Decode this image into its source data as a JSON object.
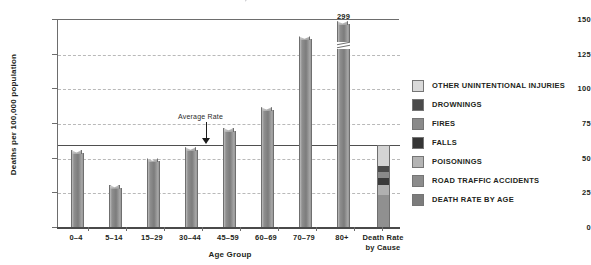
{
  "chart_data": {
    "type": "bar",
    "title": "FIGURE 1  PATTERN OF DEATH FROM INJURY BY AGE GROUP, 2000",
    "xlabel": "Age Group",
    "ylabel": "Deaths per 100,000 population",
    "ylim": [
      0,
      150
    ],
    "yticks": [
      0,
      25,
      50,
      75,
      100,
      125,
      150
    ],
    "grid": true,
    "legend_position": "right",
    "categories": [
      "0–4",
      "5–14",
      "15–29",
      "30–44",
      "45–59",
      "60–69",
      "70–79",
      "80+"
    ],
    "values": [
      54,
      29,
      48,
      56,
      70,
      85,
      136,
      299
    ],
    "value_labels": [
      "",
      "",
      "",
      "",
      "",
      "",
      "",
      "299"
    ],
    "axis_break_category": "80+",
    "annotation": {
      "label": "Average Rate",
      "value": 60
    },
    "stacked_bar": {
      "category_line1": "Death Rate",
      "category_line2": "by Cause",
      "total": 60,
      "segments": [
        {
          "name": "OTHER UNINTENTIONAL INJURIES",
          "value": 15,
          "color": "#d4d4d4"
        },
        {
          "name": "DROWNINGS",
          "value": 4,
          "color": "#4a4a4a"
        },
        {
          "name": "FIRES",
          "value": 5,
          "color": "#8a8a8a"
        },
        {
          "name": "FALLS",
          "value": 5,
          "color": "#3a3a3a"
        },
        {
          "name": "POISONINGS",
          "value": 7,
          "color": "#b0b0b0"
        },
        {
          "name": "ROAD TRAFFIC ACCIDENTS",
          "value": 24,
          "color": "#909090"
        }
      ]
    },
    "legend": [
      {
        "label": "OTHER UNINTENTIONAL INJURIES",
        "color": "#d9d9d9"
      },
      {
        "label": "DROWNINGS",
        "color": "#4a4a4a"
      },
      {
        "label": "FIRES",
        "color": "#8a8a8a"
      },
      {
        "label": "FALLS",
        "color": "#353535"
      },
      {
        "label": "POISONINGS",
        "color": "#b4b4b4"
      },
      {
        "label": "ROAD TRAFFIC ACCIDENTS",
        "color": "#8c8c8c"
      },
      {
        "label": "DEATH RATE BY AGE",
        "color": "#7c7c7c"
      }
    ]
  }
}
